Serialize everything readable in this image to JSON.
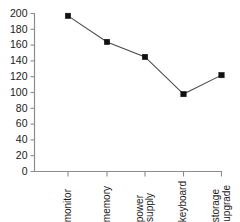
{
  "chart_data": {
    "type": "line",
    "title": "",
    "xlabel": "",
    "ylabel": "",
    "categories": [
      "monitor",
      "memory",
      "power supply",
      "keyboard",
      "storage upgrade"
    ],
    "values": [
      197,
      164,
      145,
      98,
      122
    ],
    "ylim": [
      0,
      200
    ],
    "yticks": [
      0,
      20,
      40,
      60,
      80,
      100,
      120,
      140,
      160,
      180,
      200
    ],
    "ytick_labels": [
      "0",
      "20",
      "40",
      "60",
      "80",
      "100",
      "120",
      "140",
      "160",
      "180",
      "200"
    ],
    "grid": false,
    "legend": null,
    "marker": "square",
    "marker_color": "#111111",
    "line_color": "#4a4a4a",
    "axis_color": "#8c8c8c",
    "xtick_label_rotation": 90,
    "series": [
      {
        "name": "",
        "values": [
          197,
          164,
          145,
          98,
          122
        ]
      }
    ],
    "category_lines": [
      [
        "monitor"
      ],
      [
        "memory"
      ],
      [
        "power",
        "supply"
      ],
      [
        "keyboard"
      ],
      [
        "storage",
        "upgrade"
      ]
    ]
  }
}
